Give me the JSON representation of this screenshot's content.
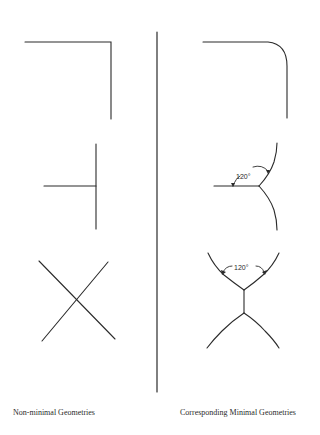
{
  "figure": {
    "stroke_color": "#2b2b2b",
    "left_column": {
      "caption": "Non-minimal Geometries",
      "shapes": [
        "right-angle-corner",
        "t-junction",
        "x-crossing"
      ]
    },
    "right_column": {
      "caption": "Corresponding Minimal Geometries",
      "shapes": [
        "rounded-corner",
        "y-junction",
        "double-y-junction"
      ],
      "angle_labels": {
        "y_junction": "120°",
        "double_y_junction": "120°"
      }
    }
  }
}
